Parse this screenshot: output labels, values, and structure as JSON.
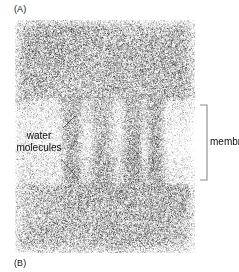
{
  "figure": {
    "panel_a_label": "(A)",
    "panel_b_label": "(B)",
    "annotations": {
      "water_molecules": {
        "line1": "water",
        "line2": "molecules"
      },
      "membrane": "membrane"
    },
    "image": {
      "kind": "molecular-dynamics-snapshot",
      "description": "Grayscale speckle simulation snapshot of water molecules around a lipid membrane with water-filled pores",
      "regions": [
        {
          "name": "upper-water-bulk",
          "y_from": 0,
          "y_to": 82,
          "density": "high"
        },
        {
          "name": "membrane-slab",
          "y_from": 82,
          "y_to": 162,
          "density": "low"
        },
        {
          "name": "lower-water-bulk",
          "y_from": 162,
          "y_to": 233,
          "density": "high"
        }
      ],
      "pores": [
        {
          "name": "pore-1",
          "x_center": 57,
          "width": 16
        },
        {
          "name": "pore-2",
          "x_center": 87,
          "width": 18
        },
        {
          "name": "pore-3",
          "x_center": 118,
          "width": 16
        },
        {
          "name": "pore-4",
          "x_center": 140,
          "width": 14
        }
      ]
    },
    "colors": {
      "background": "#ffffff",
      "particle": "#4a4a4a",
      "text": "#0d0d0d",
      "bracket": "#7a7a7a"
    }
  }
}
